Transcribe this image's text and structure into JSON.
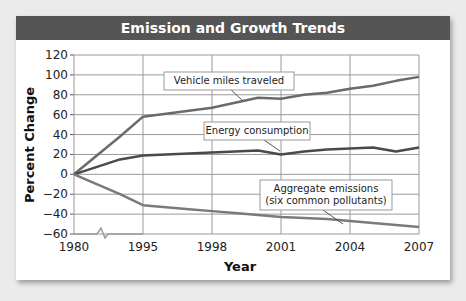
{
  "chart_data": {
    "type": "line",
    "title": "Emission and Growth Trends",
    "xlabel": "Year",
    "ylabel": "Percent Change",
    "ylim": [
      -60,
      120
    ],
    "yticks": [
      120,
      100,
      80,
      60,
      40,
      20,
      0,
      -20,
      -40,
      -60
    ],
    "xticks": [
      "1980",
      "1995",
      "1998",
      "2001",
      "2004",
      "2007"
    ],
    "axis_break": "between 1980 and 1995 on x-axis",
    "grid": true,
    "x": [
      1980,
      1990,
      1995,
      1996,
      1997,
      1998,
      1999,
      2000,
      2001,
      2002,
      2003,
      2004,
      2005,
      2006,
      2007
    ],
    "series": [
      {
        "name": "Vehicle miles traveled",
        "values": [
          0,
          38,
          58,
          61,
          64,
          67,
          72,
          77,
          76,
          80,
          82,
          86,
          89,
          94,
          98
        ]
      },
      {
        "name": "Energy consumption",
        "values": [
          0,
          15,
          19,
          20,
          21,
          22,
          23,
          24,
          20,
          23,
          25,
          26,
          27,
          23,
          27
        ]
      },
      {
        "name": "Aggregate emissions (six common pollutants)",
        "values": [
          0,
          -20,
          -31,
          -33,
          -35,
          -37,
          -39,
          -41,
          -43,
          -44,
          -45,
          -47,
          -49,
          -51,
          -53
        ]
      }
    ]
  },
  "labels": {
    "title": "Emission and Growth Trends",
    "ylabel": "Percent Change",
    "xlabel": "Year",
    "vmt": "Vehicle miles traveled",
    "energy": "Energy consumption",
    "emissions_line1": "Aggregate emissions",
    "emissions_line2": "(six common pollutants)"
  }
}
